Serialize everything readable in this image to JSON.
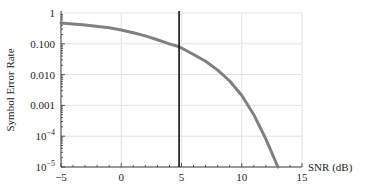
{
  "chart_data": {
    "type": "line",
    "title": "",
    "xlabel": "SNR (dB)",
    "ylabel": "Symbol Error Rate",
    "xlim": [
      -5,
      15
    ],
    "ylim": [
      1e-05,
      1
    ],
    "yscale": "log",
    "grid": true,
    "x_ticks": [
      "-5",
      "0",
      "5",
      "10",
      "15"
    ],
    "y_ticks": [
      "10^-5",
      "10^-4",
      "0.001",
      "0.010",
      "0.100",
      "1"
    ],
    "series": [
      {
        "name": "SER",
        "color": "#808080",
        "x": [
          -5,
          -3,
          -1,
          0,
          1,
          2,
          3,
          4,
          4.8,
          6,
          7,
          8,
          9,
          10,
          11,
          12,
          13
        ],
        "values": [
          0.47,
          0.41,
          0.33,
          0.28,
          0.23,
          0.18,
          0.135,
          0.1,
          0.08,
          0.045,
          0.027,
          0.014,
          0.0062,
          0.0021,
          0.0005,
          8e-05,
          1e-05
        ]
      }
    ],
    "annotations": [
      {
        "type": "vline",
        "x": 4.8,
        "color": "#000000"
      }
    ]
  }
}
